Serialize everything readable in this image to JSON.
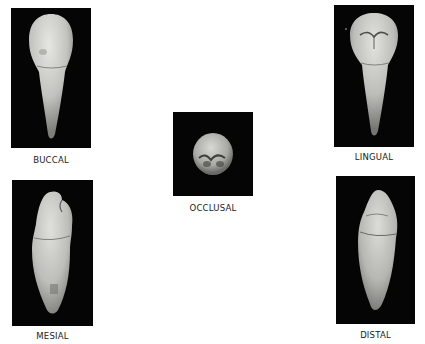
{
  "figure": {
    "views": [
      {
        "id": "buccal",
        "label": "BUCCAL"
      },
      {
        "id": "lingual",
        "label": "LINGUAL"
      },
      {
        "id": "occlusal",
        "label": "OCCLUSAL"
      },
      {
        "id": "mesial",
        "label": "MESIAL"
      },
      {
        "id": "distal",
        "label": "DISTAL"
      }
    ],
    "colors": {
      "background": "#ffffff",
      "panel": "#050505",
      "tooth_light": "#d8d8d4",
      "tooth_shadow": "#8a8a86",
      "caption": "#1a1a1a"
    }
  }
}
